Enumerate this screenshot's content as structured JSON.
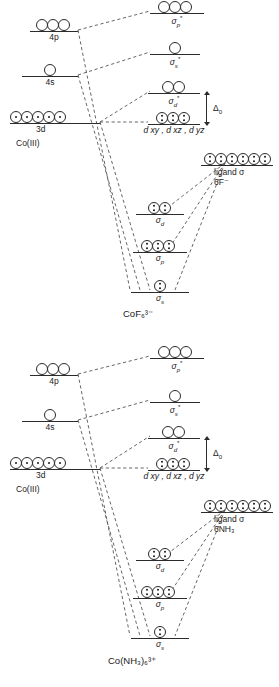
{
  "figure": {
    "type": "molecular-orbital-energy-diagram"
  },
  "diagrams": [
    {
      "id": "cof6",
      "compound": "CoF₆³⁻",
      "metal_ion_label": "Co(III)",
      "free_ion_levels": [
        {
          "name": "4p-level",
          "label": "4p",
          "orbital_count": 3,
          "electrons_per_orbital": [
            0,
            0,
            0
          ]
        },
        {
          "name": "4s-level",
          "label": "4s",
          "orbital_count": 1,
          "electrons_per_orbital": [
            0
          ]
        },
        {
          "name": "3d-level",
          "label": "3d",
          "orbital_count": 5,
          "electrons_per_orbital": [
            1,
            1,
            1,
            1,
            1
          ]
        }
      ],
      "antibonding_levels": [
        {
          "name": "sigma-p-star",
          "label_base": "σ",
          "label_sub": "p",
          "label_star": "*",
          "orbital_count": 3,
          "electrons_per_orbital": [
            0,
            0,
            0
          ]
        },
        {
          "name": "sigma-s-star",
          "label_base": "σ",
          "label_sub": "s",
          "label_star": "*",
          "orbital_count": 1,
          "electrons_per_orbital": [
            0
          ]
        },
        {
          "name": "sigma-d-star",
          "label_base": "σ",
          "label_sub": "d",
          "label_star": "*",
          "orbital_count": 2,
          "electrons_per_orbital": [
            0,
            0
          ]
        }
      ],
      "nonbonding_level": {
        "name": "t2g-level",
        "label": "d xy , d xz , d yz",
        "orbital_count": 3,
        "electrons_per_orbital": [
          2,
          2,
          2
        ]
      },
      "splitting": {
        "name": "delta-o",
        "label": "Δ",
        "sublabel": "0"
      },
      "bonding_levels": [
        {
          "name": "sigma-d",
          "label_base": "σ",
          "label_sub": "d",
          "orbital_count": 2,
          "electrons_per_orbital": [
            2,
            2
          ]
        },
        {
          "name": "sigma-p",
          "label_base": "σ",
          "label_sub": "p",
          "orbital_count": 3,
          "electrons_per_orbital": [
            2,
            2,
            2
          ]
        },
        {
          "name": "sigma-s",
          "label_base": "σ",
          "label_sub": "s",
          "orbital_count": 1,
          "electrons_per_orbital": [
            2
          ]
        }
      ],
      "ligand_level": {
        "name": "ligand-sigma",
        "line1": "ligand σ",
        "line2": "6F⁻",
        "orbital_count": 6,
        "electrons_per_orbital": [
          2,
          2,
          2,
          2,
          2,
          2
        ]
      }
    },
    {
      "id": "conh3",
      "compound": "Co(NH₃)₆³⁺",
      "metal_ion_label": "Co(III)",
      "free_ion_levels": [
        {
          "name": "4p-level",
          "label": "4p",
          "orbital_count": 3,
          "electrons_per_orbital": [
            0,
            0,
            0
          ]
        },
        {
          "name": "4s-level",
          "label": "4s",
          "orbital_count": 1,
          "electrons_per_orbital": [
            0
          ]
        },
        {
          "name": "3d-level",
          "label": "3d",
          "orbital_count": 5,
          "electrons_per_orbital": [
            1,
            1,
            1,
            1,
            1
          ]
        }
      ],
      "antibonding_levels": [
        {
          "name": "sigma-p-star",
          "label_base": "σ",
          "label_sub": "p",
          "label_star": "*",
          "orbital_count": 3,
          "electrons_per_orbital": [
            0,
            0,
            0
          ]
        },
        {
          "name": "sigma-s-star",
          "label_base": "σ",
          "label_sub": "s",
          "label_star": "*",
          "orbital_count": 1,
          "electrons_per_orbital": [
            0
          ]
        },
        {
          "name": "sigma-d-star",
          "label_base": "σ",
          "label_sub": "d",
          "label_star": "*",
          "orbital_count": 2,
          "electrons_per_orbital": [
            0,
            0
          ]
        }
      ],
      "nonbonding_level": {
        "name": "t2g-level",
        "label": "d xy , d xz , d yz",
        "orbital_count": 3,
        "electrons_per_orbital": [
          2,
          2,
          2
        ]
      },
      "splitting": {
        "name": "delta-o",
        "label": "Δ",
        "sublabel": "0"
      },
      "bonding_levels": [
        {
          "name": "sigma-d",
          "label_base": "σ",
          "label_sub": "d",
          "orbital_count": 2,
          "electrons_per_orbital": [
            2,
            2
          ]
        },
        {
          "name": "sigma-p",
          "label_base": "σ",
          "label_sub": "p",
          "orbital_count": 3,
          "electrons_per_orbital": [
            2,
            2,
            2
          ]
        },
        {
          "name": "sigma-s",
          "label_base": "σ",
          "label_sub": "s",
          "orbital_count": 1,
          "electrons_per_orbital": [
            2
          ]
        }
      ],
      "ligand_level": {
        "name": "ligand-sigma",
        "line1": "ligand σ",
        "line2": "6NH₃",
        "orbital_count": 6,
        "electrons_per_orbital": [
          2,
          2,
          2,
          2,
          2,
          2
        ]
      }
    }
  ]
}
